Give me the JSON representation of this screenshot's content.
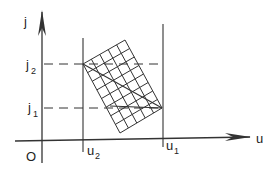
{
  "diagram": {
    "axes": {
      "x_label": "u",
      "y_label": "j",
      "origin_label": "O"
    },
    "vertical_markers": [
      {
        "label": "u",
        "sub": "2",
        "x": 83
      },
      {
        "label": "u",
        "sub": "1",
        "x": 163
      }
    ],
    "horizontal_markers": [
      {
        "label": "j",
        "sub": "2",
        "y": 64
      },
      {
        "label": "j",
        "sub": "1",
        "y": 108
      }
    ],
    "grid": {
      "corners": [
        [
          83,
          64
        ],
        [
          125,
          40
        ],
        [
          162,
          108
        ],
        [
          120,
          133
        ]
      ],
      "cells_short_side": 5,
      "cells_long_side": 8
    },
    "colors": {
      "stroke": "#333333",
      "background": "#ffffff"
    }
  }
}
